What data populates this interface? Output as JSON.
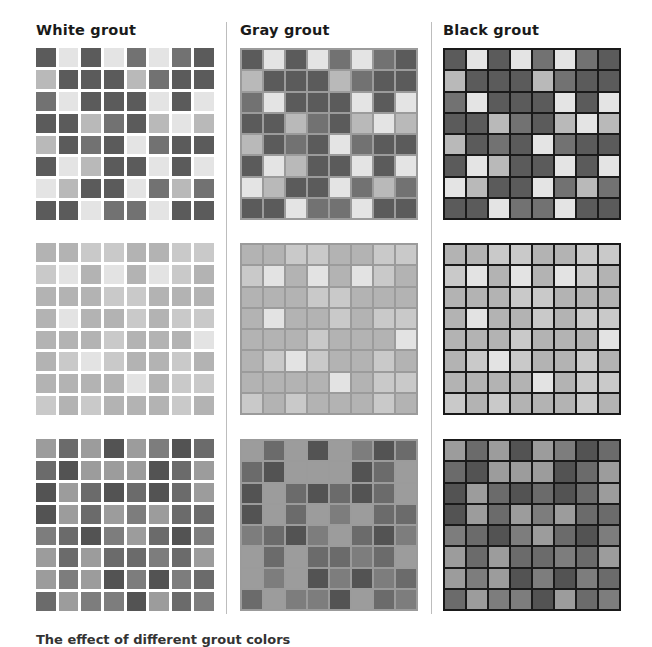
{
  "headings": {
    "white": "White grout",
    "gray": "Gray grout",
    "black": "Black grout"
  },
  "caption": "The effect of different grout colors",
  "grout_colors": {
    "white": "#ffffff",
    "gray": "#9b9b9b",
    "black": "#1a1a1a"
  },
  "palettes": {
    "dark_mix": {
      "D": "#5b5b5b",
      "M": "#727272",
      "L": "#b9b9b9",
      "W": "#e4e4e4"
    },
    "light_mix": {
      "a": "#b3b3b3",
      "b": "#c9c9c9",
      "c": "#e3e3e3"
    },
    "mid_mix": {
      "p": "#9c9c9c",
      "m": "#7d7d7d",
      "q": "#6b6b6b",
      "r": "#535353"
    }
  },
  "patterns": [
    {
      "palette": "dark_mix",
      "rows": [
        "DWDWMWMD",
        "LDDDLMDD",
        "MWDDDWDW",
        "DDLMDLWL",
        "LDMDWMDD",
        "DWLDDWDW",
        "WLDDWMLM",
        "DDWMMWDD"
      ]
    },
    {
      "palette": "light_mix",
      "rows": [
        "aabbaabb",
        "bcacacba",
        "aaabbaaa",
        "acaababb",
        "aaabaaac",
        "abcbaaba",
        "aaaacabb",
        "babaaaba"
      ]
    },
    {
      "palette": "mid_mix",
      "rows": [
        "pqprpmrq",
        "qrppprqp",
        "rpqrqrqp",
        "rpqpmpqq",
        "mqrmpqrm",
        "pqpqqmqp",
        "pmprmrmq",
        "qpmmrpqm"
      ]
    }
  ],
  "columns": [
    "white",
    "gray",
    "black"
  ]
}
